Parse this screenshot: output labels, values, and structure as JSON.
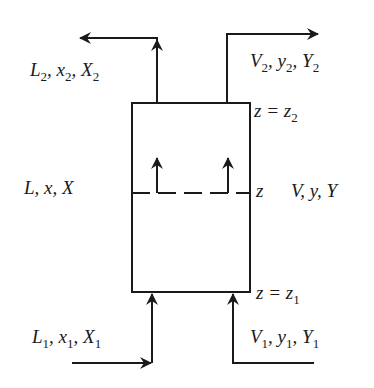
{
  "diagram": {
    "stroke_color": "#1a1a1a",
    "streams": {
      "liquid_out_top": {
        "label": "L",
        "sub": "2",
        "x_label": "x",
        "X_label": "X"
      },
      "vapor_out_top": {
        "label": "V",
        "sub": "2",
        "y_label": "y",
        "Y_label": "Y"
      },
      "liquid_in_bottom": {
        "label": "L",
        "sub": "1",
        "x_label": "x",
        "X_label": "X"
      },
      "vapor_in_bottom": {
        "label": "V",
        "sub": "1",
        "y_label": "y",
        "Y_label": "Y"
      },
      "liquid_mid": {
        "text": "L, x, X"
      },
      "vapor_mid": {
        "text": "V, y, Y"
      }
    },
    "positions": {
      "top": {
        "z": "z",
        "eq": " = ",
        "zsub": "z",
        "sub": "2"
      },
      "middle": {
        "z": "z"
      },
      "bottom": {
        "z": "z",
        "eq": " = ",
        "zsub": "z",
        "sub": "1"
      }
    }
  }
}
